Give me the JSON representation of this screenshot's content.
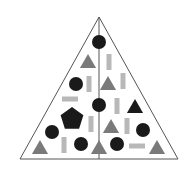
{
  "diagram": {
    "type": "shape-triangle-puzzle",
    "colors": {
      "outline": "#555555",
      "dark": "#1a1a1a",
      "triangle_gray": "#7a7a7a",
      "bar_gray": "#b8b8b8",
      "background": "#ffffff"
    },
    "frame": {
      "apex": [
        99,
        17
      ],
      "base_left": [
        20,
        159
      ],
      "base_right": [
        178,
        159
      ],
      "divider_x": 99
    },
    "shapes": [
      {
        "kind": "circle",
        "color": "dark",
        "cx": 99,
        "cy": 42,
        "r": 7
      },
      {
        "kind": "triangle",
        "color": "gray",
        "cx": 88,
        "cy": 61,
        "size": 14
      },
      {
        "kind": "vbar",
        "color": "bar",
        "cx": 109,
        "cy": 62
      },
      {
        "kind": "circle",
        "color": "dark",
        "cx": 76,
        "cy": 84,
        "r": 7
      },
      {
        "kind": "vbar",
        "color": "bar",
        "cx": 89,
        "cy": 84
      },
      {
        "kind": "triangle",
        "color": "gray",
        "cx": 108,
        "cy": 83,
        "size": 14
      },
      {
        "kind": "vbar",
        "color": "bar",
        "cx": 123,
        "cy": 81
      },
      {
        "kind": "hbar",
        "color": "bar",
        "cx": 70,
        "cy": 99
      },
      {
        "kind": "circle",
        "color": "dark",
        "cx": 99,
        "cy": 105,
        "r": 7
      },
      {
        "kind": "vbar",
        "color": "bar",
        "cx": 117,
        "cy": 106
      },
      {
        "kind": "triangle",
        "color": "dark",
        "cx": 135,
        "cy": 106,
        "size": 14
      },
      {
        "kind": "pentagon",
        "color": "dark",
        "cx": 72,
        "cy": 119,
        "r": 12
      },
      {
        "kind": "vbar",
        "color": "bar",
        "cx": 91,
        "cy": 124
      },
      {
        "kind": "triangle",
        "color": "gray",
        "cx": 111,
        "cy": 126,
        "size": 14
      },
      {
        "kind": "vbar",
        "color": "bar",
        "cx": 127,
        "cy": 126
      },
      {
        "kind": "circle",
        "color": "dark",
        "cx": 52,
        "cy": 132,
        "r": 7
      },
      {
        "kind": "circle",
        "color": "dark",
        "cx": 143,
        "cy": 130,
        "r": 7
      },
      {
        "kind": "triangle",
        "color": "gray",
        "cx": 40,
        "cy": 147,
        "size": 14
      },
      {
        "kind": "vbar",
        "color": "bar",
        "cx": 64,
        "cy": 145
      },
      {
        "kind": "circle",
        "color": "dark",
        "cx": 81,
        "cy": 144,
        "r": 7
      },
      {
        "kind": "triangle",
        "color": "gray",
        "cx": 99,
        "cy": 147,
        "size": 14
      },
      {
        "kind": "circle",
        "color": "dark",
        "cx": 117,
        "cy": 144,
        "r": 7
      },
      {
        "kind": "hbar",
        "color": "bar",
        "cx": 137,
        "cy": 146
      },
      {
        "kind": "triangle",
        "color": "gray",
        "cx": 157,
        "cy": 147,
        "size": 14
      }
    ]
  }
}
